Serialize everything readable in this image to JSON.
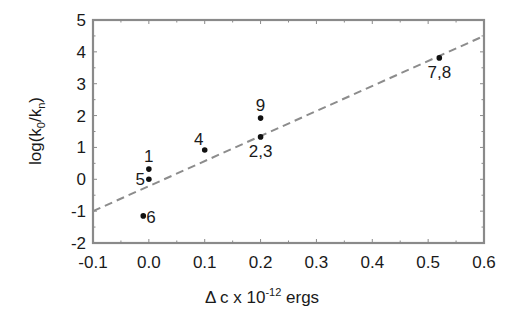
{
  "chart_data": {
    "type": "scatter",
    "title": "",
    "xlabel": "Δ c x 10⁻¹² ergs",
    "xlabel_parts": {
      "prefix": "Δ c x 10",
      "superscript": "-12",
      "suffix": " ergs"
    },
    "ylabel": "log(k0/kn)",
    "ylabel_parts": {
      "prefix": "log(k",
      "sub1": "0",
      "mid": "/k",
      "sub2": "n",
      "suffix": ")"
    },
    "xlim": [
      -0.1,
      0.6
    ],
    "ylim": [
      -2,
      5
    ],
    "xticks": [
      -0.1,
      0.0,
      0.1,
      0.2,
      0.3,
      0.4,
      0.5,
      0.6
    ],
    "xtick_labels": [
      "-0.1",
      "0.0",
      "0.1",
      "0.2",
      "0.3",
      "0.4",
      "0.5",
      "0.6"
    ],
    "yticks": [
      -2,
      -1,
      0,
      1,
      2,
      3,
      4,
      5
    ],
    "ytick_labels": [
      "-2",
      "-1",
      "0",
      "1",
      "2",
      "3",
      "4",
      "5"
    ],
    "grid": false,
    "legend": null,
    "points": [
      {
        "label": "1",
        "x": 0.0,
        "y": 0.32,
        "label_pos": "above"
      },
      {
        "label": "5",
        "x": 0.0,
        "y": 0.0,
        "label_pos": "left"
      },
      {
        "label": "6",
        "x": -0.01,
        "y": -1.15,
        "label_pos": "right"
      },
      {
        "label": "4",
        "x": 0.1,
        "y": 0.92,
        "label_pos": "above-left"
      },
      {
        "label": "9",
        "x": 0.2,
        "y": 1.92,
        "label_pos": "above"
      },
      {
        "label": "2,3",
        "x": 0.2,
        "y": 1.33,
        "label_pos": "below"
      },
      {
        "label": "7,8",
        "x": 0.52,
        "y": 3.81,
        "label_pos": "below"
      }
    ],
    "fit_line": {
      "style": "dashed",
      "color": "#8c8c8c",
      "x": [
        -0.1,
        0.6
      ],
      "y": [
        -1.0,
        4.5
      ]
    },
    "colors": {
      "axis": "#8a8a8a",
      "point": "#111111",
      "text": "#1a1a1a"
    }
  }
}
